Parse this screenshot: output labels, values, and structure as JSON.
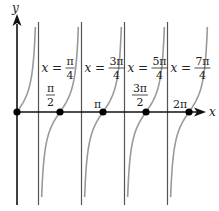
{
  "chart_data": {
    "type": "line",
    "title": "",
    "function_description": "tangent-type curve with period pi/2 (y = tan 2x)",
    "xlabel": "x",
    "ylabel": "y",
    "xlim": [
      0,
      6.6
    ],
    "x_ticks": [
      {
        "value": 0,
        "label": ""
      },
      {
        "value": 1.5708,
        "label": "π/2",
        "num": "π",
        "den": "2"
      },
      {
        "value": 3.1416,
        "label": "π",
        "num": "π",
        "den": ""
      },
      {
        "value": 4.7124,
        "label": "3π/2",
        "num": "3π",
        "den": "2"
      },
      {
        "value": 6.2832,
        "label": "2π",
        "num": "2π",
        "den": ""
      }
    ],
    "zeros": [
      0,
      1.5708,
      3.1416,
      4.7124,
      6.2832
    ],
    "zero_labels": [
      "0",
      "π/2",
      "π",
      "3π/2",
      "2π"
    ],
    "asymptotes": [
      {
        "value": 0.7854,
        "label": "x = π/4",
        "num": "π",
        "den": "4"
      },
      {
        "value": 2.3562,
        "label": "x = 3π/4",
        "num": "3π",
        "den": "4"
      },
      {
        "value": 3.927,
        "label": "x = 5π/4",
        "num": "5π",
        "den": "4"
      },
      {
        "value": 5.4978,
        "label": "x = 7π/4",
        "num": "7π",
        "den": "4"
      }
    ],
    "grid": false,
    "legend": null,
    "colors": {
      "axes": "#111111",
      "curve": "#9a9a9a",
      "asymptote": "#555555",
      "points": "#000000"
    }
  }
}
